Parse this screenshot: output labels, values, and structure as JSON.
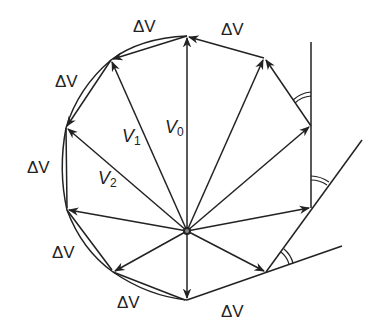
{
  "diagram": {
    "title": "",
    "colors": {
      "stroke": "#222222",
      "background": "#ffffff"
    },
    "labels": {
      "dv_top": "ΔV",
      "dv_top_right": "ΔV",
      "dv_upper_left": "ΔV",
      "dv_left": "ΔV",
      "dv_lower_left": "ΔV",
      "dv_bottom_left": "ΔV",
      "dv_bottom": "ΔV",
      "dv_bottom_right": "ΔV",
      "v0": "V",
      "v0_sub": "0",
      "v1": "V",
      "v1_sub": "1",
      "v2": "V",
      "v2_sub": "2"
    },
    "center": [
      187,
      231
    ],
    "vector_tips": [
      [
        187,
        36
      ],
      [
        111,
        60
      ],
      [
        66,
        128
      ],
      [
        67,
        210
      ],
      [
        113,
        272
      ],
      [
        187,
        300
      ],
      [
        266,
        272
      ],
      [
        311,
        208
      ],
      [
        311,
        126
      ],
      [
        264,
        58
      ]
    ]
  }
}
